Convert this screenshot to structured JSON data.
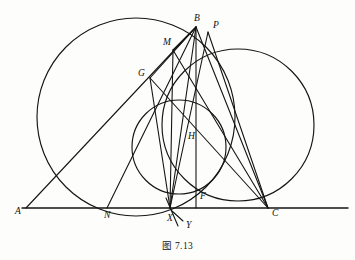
{
  "figure": {
    "caption": "图 7.13",
    "stroke_color": "#151515",
    "background_color": "#fdfdfb",
    "width": 355,
    "height": 260,
    "points": [
      {
        "id": "A",
        "label": "A",
        "x": 26,
        "y": 208,
        "label_x": 15,
        "label_y": 214
      },
      {
        "id": "B",
        "label": "B",
        "x": 196,
        "y": 27,
        "label_x": 194,
        "label_y": 21
      },
      {
        "id": "C",
        "label": "C",
        "x": 268,
        "y": 208,
        "label_x": 272,
        "label_y": 216
      },
      {
        "id": "P",
        "label": "P",
        "x": 208,
        "y": 32,
        "label_x": 213,
        "label_y": 28
      },
      {
        "id": "M",
        "label": "M",
        "x": 173,
        "y": 50,
        "label_x": 163,
        "label_y": 45
      },
      {
        "id": "G",
        "label": "G",
        "x": 150,
        "y": 78,
        "label_x": 138,
        "label_y": 76
      },
      {
        "id": "H",
        "label": "H",
        "x": 196,
        "y": 140,
        "label_x": 188,
        "label_y": 139
      },
      {
        "id": "F",
        "label": "F",
        "x": 196,
        "y": 208,
        "label_x": 200,
        "label_y": 199
      },
      {
        "id": "N",
        "label": "N",
        "x": 107,
        "y": 208,
        "label_x": 104,
        "label_y": 218
      },
      {
        "id": "X",
        "label": "X",
        "x": 170,
        "y": 208,
        "label_x": 167,
        "label_y": 221
      },
      {
        "id": "Y",
        "label": "Y",
        "x": 176,
        "y": 222,
        "label_x": 186,
        "label_y": 227
      }
    ],
    "circles": [
      {
        "id": "circumcircle-left",
        "cx": 136,
        "cy": 117,
        "r": 99
      },
      {
        "id": "circle-middle",
        "cx": 179,
        "cy": 147,
        "r": 47
      },
      {
        "id": "circle-right",
        "cx": 238,
        "cy": 125,
        "r": 76
      }
    ],
    "segments": [
      {
        "id": "baseline-A-C-extended",
        "from": "A-extended",
        "to": "C-extended"
      },
      {
        "id": "A-to-B"
      },
      {
        "id": "B-to-C"
      },
      {
        "id": "B-to-F"
      },
      {
        "id": "B-to-X"
      },
      {
        "id": "B-to-N"
      },
      {
        "id": "B-to-G"
      },
      {
        "id": "B-to-M"
      },
      {
        "id": "G-to-C"
      },
      {
        "id": "M-to-C"
      },
      {
        "id": "P-to-C"
      },
      {
        "id": "P-to-X"
      },
      {
        "id": "M-to-X"
      },
      {
        "id": "G-to-X"
      },
      {
        "id": "X-to-Y"
      }
    ]
  }
}
